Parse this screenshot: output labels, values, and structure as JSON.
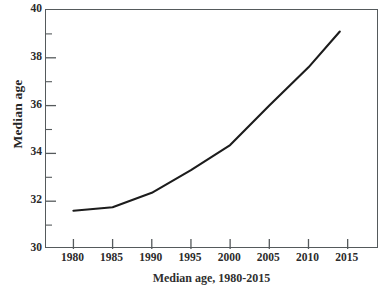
{
  "figure": {
    "caption": "Median age, 1980-2015"
  },
  "axes": {
    "ylabel": "Median age",
    "xlabel": "",
    "y_ticks": [
      30,
      32,
      34,
      36,
      38,
      40
    ],
    "y_tick_labels": [
      "30",
      "32",
      "34",
      "36",
      "38",
      "40"
    ],
    "y_minor_ticks": [
      31,
      33,
      35,
      37,
      39
    ],
    "x_ticks": [
      1980,
      1985,
      1990,
      1995,
      2000,
      2005,
      2010,
      2015
    ],
    "x_tick_labels": [
      "1980",
      "1985",
      "1990",
      "1995",
      "2000",
      "2005",
      "2010",
      "2015"
    ],
    "line_color": "#1c1c1c",
    "frame_color": "#555a5c"
  },
  "chart_data": {
    "type": "line",
    "title": "",
    "xlabel": "",
    "ylabel": "Median age",
    "xlim": [
      1976.5,
      2019
    ],
    "ylim": [
      30,
      40
    ],
    "grid": false,
    "legend": "none",
    "x": [
      1980,
      1985,
      1990,
      1995,
      2000,
      2005,
      2010,
      2014
    ],
    "series": [
      {
        "name": "Median age",
        "values": [
          31.6,
          31.75,
          32.35,
          33.3,
          34.35,
          36.0,
          37.6,
          39.1
        ]
      }
    ],
    "x_tick_labels": [
      "1980",
      "1985",
      "1990",
      "1995",
      "2000",
      "2005",
      "2010",
      "2015"
    ],
    "y_tick_labels": [
      "30",
      "32",
      "34",
      "36",
      "38",
      "40"
    ]
  }
}
